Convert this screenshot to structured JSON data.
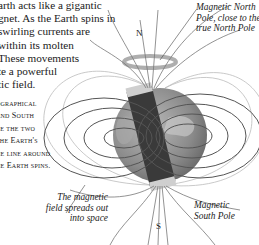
{
  "intro_text": {
    "lines": [
      "arth acts like a gigantic",
      "gnet. As the Earth spins in",
      "swirling currents are",
      "within its molten",
      "These movements",
      "te a powerful",
      "tic field."
    ]
  },
  "side_note": {
    "lines": [
      "ographical",
      "and South",
      "re the two",
      "the Earth's",
      "he line around",
      "he Earth spins."
    ]
  },
  "labels": {
    "north_pole": [
      "Magnetic North",
      "Pole, close to the",
      "true North Pole"
    ],
    "south_pole": [
      "Magnetic",
      "South Pole"
    ],
    "field": [
      "The magnetic",
      "field spreads out",
      "into space"
    ]
  },
  "poles": {
    "n": "N",
    "s": "S"
  },
  "colors": {
    "globe": "#8a8a8a",
    "magnet": "#3a3a3a",
    "field_lines": "#555555",
    "ring": "#9a9a9a"
  }
}
